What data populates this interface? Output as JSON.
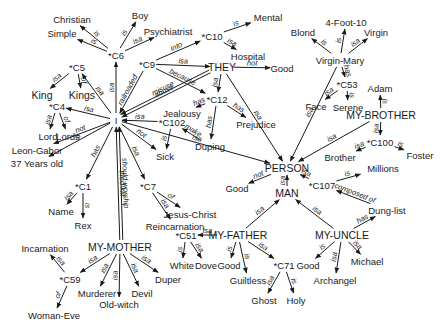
{
  "diagram": {
    "type": "semantic-network",
    "nodes": [
      {
        "id": "I",
        "label": "I",
        "x": 116,
        "y": 120
      },
      {
        "id": "C6",
        "label": "*C6",
        "x": 116,
        "y": 55
      },
      {
        "id": "Christian",
        "label": "Christian",
        "x": 72,
        "y": 19
      },
      {
        "id": "Boy",
        "label": "Boy",
        "x": 140,
        "y": 15
      },
      {
        "id": "Simple",
        "label": "Simple",
        "x": 62,
        "y": 33
      },
      {
        "id": "Psychiatrist",
        "label": "Psychiatrist",
        "x": 168,
        "y": 31
      },
      {
        "id": "C5",
        "label": "*C5",
        "x": 77,
        "y": 67
      },
      {
        "id": "King",
        "label": "King",
        "x": 42,
        "y": 95
      },
      {
        "id": "Kings",
        "label": "Kings",
        "x": 82,
        "y": 95
      },
      {
        "id": "C4",
        "label": "*C4",
        "x": 57,
        "y": 106
      },
      {
        "id": "Lord",
        "label": "Lord",
        "x": 48,
        "y": 136
      },
      {
        "id": "Lords",
        "label": "Lords",
        "x": 68,
        "y": 136
      },
      {
        "id": "Leon-Gabor",
        "label": "Leon-Gabor",
        "x": 37,
        "y": 150
      },
      {
        "id": "37Years",
        "label": "37 Years old",
        "x": 37,
        "y": 163
      },
      {
        "id": "C1",
        "label": "*C1",
        "x": 83,
        "y": 186
      },
      {
        "id": "Name",
        "label": "Name",
        "x": 61,
        "y": 211
      },
      {
        "id": "Rex",
        "label": "Rex",
        "x": 83,
        "y": 225
      },
      {
        "id": "C7",
        "label": "*C7",
        "x": 148,
        "y": 186
      },
      {
        "id": "Jesus-Christ",
        "label": "Jesus-Christ",
        "x": 190,
        "y": 214
      },
      {
        "id": "Reincarnation",
        "label": "Reincarnation",
        "x": 175,
        "y": 226
      },
      {
        "id": "C9",
        "label": "*C9",
        "x": 147,
        "y": 64
      },
      {
        "id": "C10",
        "label": "*C10",
        "x": 212,
        "y": 36
      },
      {
        "id": "Mental",
        "label": "Mental",
        "x": 268,
        "y": 17
      },
      {
        "id": "Hospital",
        "label": "Hospital",
        "x": 248,
        "y": 56
      },
      {
        "id": "THEY",
        "label": "THEY",
        "x": 222,
        "y": 67
      },
      {
        "id": "Good1",
        "label": "Good",
        "x": 282,
        "y": 68
      },
      {
        "id": "C12",
        "label": "*C12",
        "x": 217,
        "y": 99
      },
      {
        "id": "Jealousy",
        "label": "Jealousy",
        "x": 182,
        "y": 113
      },
      {
        "id": "Prejudice",
        "label": "Prejudice",
        "x": 256,
        "y": 124
      },
      {
        "id": "C102",
        "label": "*C102",
        "x": 172,
        "y": 122
      },
      {
        "id": "Duping",
        "label": "Duping",
        "x": 210,
        "y": 146
      },
      {
        "id": "Sick",
        "label": "Sick",
        "x": 165,
        "y": 156
      },
      {
        "id": "PERSON",
        "label": "PERSON",
        "x": 287,
        "y": 168
      },
      {
        "id": "4Foot10",
        "label": "4-Foot-10",
        "x": 346,
        "y": 22
      },
      {
        "id": "Blond",
        "label": "Blond",
        "x": 303,
        "y": 32
      },
      {
        "id": "Virgin",
        "label": "Virgin",
        "x": 376,
        "y": 32
      },
      {
        "id": "Virgin-Mary",
        "label": "Virgin-Mary",
        "x": 340,
        "y": 60
      },
      {
        "id": "C53",
        "label": "*C53",
        "x": 347,
        "y": 84
      },
      {
        "id": "Face",
        "label": "Face",
        "x": 316,
        "y": 106
      },
      {
        "id": "Serene",
        "label": "Serene",
        "x": 348,
        "y": 107
      },
      {
        "id": "Adam",
        "label": "Adam",
        "x": 380,
        "y": 88
      },
      {
        "id": "MY-BROTHER",
        "label": "MY-BROTHER",
        "x": 381,
        "y": 115
      },
      {
        "id": "C100",
        "label": "*C100",
        "x": 380,
        "y": 142
      },
      {
        "id": "Brother",
        "label": "Brother",
        "x": 340,
        "y": 157
      },
      {
        "id": "Foster",
        "label": "Foster",
        "x": 420,
        "y": 155
      },
      {
        "id": "Millions",
        "label": "Millions",
        "x": 383,
        "y": 168
      },
      {
        "id": "C107",
        "label": "*C107",
        "x": 322,
        "y": 185
      },
      {
        "id": "Good2",
        "label": "Good",
        "x": 237,
        "y": 188
      },
      {
        "id": "MAN",
        "label": "MAN",
        "x": 287,
        "y": 193
      },
      {
        "id": "Dung-list",
        "label": "Dung-list",
        "x": 387,
        "y": 210
      },
      {
        "id": "MY-FATHER",
        "label": "MY-FATHER",
        "x": 238,
        "y": 235
      },
      {
        "id": "MY-UNCLE",
        "label": "MY-UNCLE",
        "x": 342,
        "y": 235
      },
      {
        "id": "C51",
        "label": "*C51",
        "x": 186,
        "y": 235
      },
      {
        "id": "White",
        "label": "White",
        "x": 182,
        "y": 265
      },
      {
        "id": "Dove",
        "label": "Dove",
        "x": 206,
        "y": 265
      },
      {
        "id": "Good3",
        "label": "Good",
        "x": 229,
        "y": 265
      },
      {
        "id": "Guiltless",
        "label": "Guiltless",
        "x": 248,
        "y": 280
      },
      {
        "id": "C71",
        "label": "*C71",
        "x": 284,
        "y": 265
      },
      {
        "id": "Ghost",
        "label": "Ghost",
        "x": 264,
        "y": 300
      },
      {
        "id": "Holy",
        "label": "Holy",
        "x": 296,
        "y": 300
      },
      {
        "id": "Good4",
        "label": "Good",
        "x": 308,
        "y": 265
      },
      {
        "id": "Archangel",
        "label": "Archangel",
        "x": 335,
        "y": 280
      },
      {
        "id": "Michael",
        "label": "Michael",
        "x": 367,
        "y": 261
      },
      {
        "id": "MY-MOTHER",
        "label": "MY-MOTHER",
        "x": 120,
        "y": 247
      },
      {
        "id": "Incarnation",
        "label": "Incarnation",
        "x": 45,
        "y": 248
      },
      {
        "id": "C59",
        "label": "*C59",
        "x": 70,
        "y": 279
      },
      {
        "id": "Woman-Eve",
        "label": "Woman-Eve",
        "x": 54,
        "y": 315
      },
      {
        "id": "Murderer",
        "label": "Murderer",
        "x": 97,
        "y": 293
      },
      {
        "id": "Old-witch",
        "label": "Old-witch",
        "x": 119,
        "y": 304
      },
      {
        "id": "Devil",
        "label": "Devil",
        "x": 142,
        "y": 293
      },
      {
        "id": "Duper",
        "label": "Duper",
        "x": 168,
        "y": 279
      }
    ],
    "edges": [
      {
        "label": "is",
        "from": "C6",
        "to": "Christian"
      },
      {
        "label": "is",
        "from": "C6",
        "to": "Boy"
      },
      {
        "label": "is",
        "from": "C6",
        "to": "Simple"
      },
      {
        "label": "isa",
        "from": "C6",
        "to": "Psychiatrist"
      },
      {
        "label": "isa",
        "from": "I",
        "to": "C6"
      },
      {
        "label": "isa",
        "from": "I",
        "to": "C5"
      },
      {
        "label": "isa",
        "from": "C5",
        "to": "King"
      },
      {
        "label": "of",
        "from": "C5",
        "to": "Kings"
      },
      {
        "label": "isa",
        "from": "I",
        "to": "C4"
      },
      {
        "label": "isa",
        "from": "C4",
        "to": "Lord"
      },
      {
        "label": "of",
        "from": "C4",
        "to": "Lords"
      },
      {
        "label": "not",
        "from": "I",
        "to": "Leon-Gabor"
      },
      {
        "label": "is",
        "from": "I",
        "to": "37Years"
      },
      {
        "label": "has",
        "from": "I",
        "to": "C1"
      },
      {
        "label": "isa",
        "from": "C1",
        "to": "Name"
      },
      {
        "label": "is",
        "from": "C1",
        "to": "Rex"
      },
      {
        "label": "isa",
        "from": "I",
        "to": "C7"
      },
      {
        "label": "of",
        "from": "C7",
        "to": "Jesus-Christ"
      },
      {
        "label": "isa",
        "from": "C7",
        "to": "Reincarnation"
      },
      {
        "label": "railroaded",
        "from": "C9",
        "to": "I"
      },
      {
        "label": "into",
        "from": "C9",
        "to": "C10"
      },
      {
        "label": "is",
        "from": "C10",
        "to": "Mental"
      },
      {
        "label": "isa",
        "from": "C10",
        "to": "Hospital"
      },
      {
        "label": "isa",
        "from": "C9",
        "to": "THEY"
      },
      {
        "label": "because",
        "from": "C9",
        "to": "C12"
      },
      {
        "label": "not",
        "from": "THEY",
        "to": "Good1"
      },
      {
        "label": "abuse",
        "from": "THEY",
        "to": "I"
      },
      {
        "label": "misuse",
        "from": "THEY",
        "to": "I"
      },
      {
        "label": "isa",
        "from": "THEY",
        "to": "C12"
      },
      {
        "label": "isa",
        "from": "THEY",
        "to": "PERSON"
      },
      {
        "label": "has",
        "from": "C12",
        "to": "Jealousy"
      },
      {
        "label": "has",
        "from": "C12",
        "to": "Prejudice"
      },
      {
        "label": "has",
        "from": "C12",
        "to": "Duping"
      },
      {
        "label": "isa",
        "from": "C102",
        "to": "I"
      },
      {
        "label": "make",
        "from": "Duping",
        "to": "C102"
      },
      {
        "label": "is",
        "from": "C102",
        "to": "Sick"
      },
      {
        "label": "not",
        "from": "I",
        "to": "Sick"
      },
      {
        "label": "isa",
        "from": "I",
        "to": "PERSON"
      },
      {
        "label": "tried-kill",
        "from": "MY-MOTHER",
        "to": "I"
      },
      {
        "label": "should-worship",
        "from": "MY-MOTHER",
        "to": "I"
      },
      {
        "label": "is",
        "from": "Virgin-Mary",
        "to": "Blond"
      },
      {
        "label": "is",
        "from": "Virgin-Mary",
        "to": "4Foot10"
      },
      {
        "label": "isa",
        "from": "Virgin-Mary",
        "to": "Virgin"
      },
      {
        "label": "has",
        "from": "Virgin-Mary",
        "to": "C53"
      },
      {
        "label": "isa",
        "from": "C53",
        "to": "Face"
      },
      {
        "label": "is",
        "from": "C53",
        "to": "Serene"
      },
      {
        "label": "isa",
        "from": "Virgin-Mary",
        "to": "PERSON"
      },
      {
        "label": "is",
        "from": "MY-BROTHER",
        "to": "Adam"
      },
      {
        "label": "isa",
        "from": "MY-BROTHER",
        "to": "PERSON"
      },
      {
        "label": "isa",
        "from": "MY-BROTHER",
        "to": "C100"
      },
      {
        "label": "isa",
        "from": "C100",
        "to": "Brother"
      },
      {
        "label": "is",
        "from": "C100",
        "to": "Foster"
      },
      {
        "label": "isa",
        "from": "C107",
        "to": "PERSON"
      },
      {
        "label": "is",
        "from": "C107",
        "to": "Millions"
      },
      {
        "label": "composed of",
        "from": "Dung-list",
        "to": "C107"
      },
      {
        "label": "not",
        "from": "PERSON",
        "to": "Good2"
      },
      {
        "label": "isa",
        "from": "MAN",
        "to": "PERSON"
      },
      {
        "label": "isa",
        "from": "MY-FATHER",
        "to": "MAN"
      },
      {
        "label": "isa",
        "from": "MY-UNCLE",
        "to": "MAN"
      },
      {
        "label": "has",
        "from": "MY-UNCLE",
        "to": "Dung-list"
      },
      {
        "label": "isa",
        "from": "MY-FATHER",
        "to": "C51"
      },
      {
        "label": "is",
        "from": "C51",
        "to": "White"
      },
      {
        "label": "isa",
        "from": "C51",
        "to": "Dove"
      },
      {
        "label": "is",
        "from": "MY-FATHER",
        "to": "Good3"
      },
      {
        "label": "is",
        "from": "MY-FATHER",
        "to": "Guiltless"
      },
      {
        "label": "isa",
        "from": "MY-FATHER",
        "to": "C71"
      },
      {
        "label": "isa",
        "from": "C71",
        "to": "Ghost"
      },
      {
        "label": "is",
        "from": "C71",
        "to": "Holy"
      },
      {
        "label": "is",
        "from": "MY-UNCLE",
        "to": "Good4"
      },
      {
        "label": "isa",
        "from": "MY-UNCLE",
        "to": "Archangel"
      },
      {
        "label": "isa",
        "from": "MY-UNCLE",
        "to": "Michael"
      },
      {
        "label": "isa",
        "from": "MY-MOTHER",
        "to": "C59"
      },
      {
        "label": "isa",
        "from": "C59",
        "to": "Incarnation"
      },
      {
        "label": "of",
        "from": "C59",
        "to": "Woman-Eve"
      },
      {
        "label": "isa",
        "from": "MY-MOTHER",
        "to": "Murderer"
      },
      {
        "label": "isa",
        "from": "MY-MOTHER",
        "to": "Old-witch"
      },
      {
        "label": "isa",
        "from": "MY-MOTHER",
        "to": "Devil"
      },
      {
        "label": "isa",
        "from": "MY-MOTHER",
        "to": "Duper"
      }
    ],
    "colors": {
      "ink": "#1a1a1a",
      "background": "#ffffff"
    }
  }
}
